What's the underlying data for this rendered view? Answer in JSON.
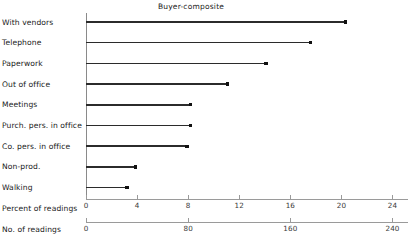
{
  "chart_data": {
    "type": "bar",
    "orientation": "horizontal",
    "title": "Buyer-composite",
    "xlabel": "",
    "ylabel": "",
    "grid": false,
    "legend": null,
    "categories": [
      "With vendors",
      "Telephone",
      "Paperwork",
      "Out of office",
      "Meetings",
      "Purch. pers. in office",
      "Co. pers. in office",
      "Non-prod.",
      "Walking"
    ],
    "values": [
      20.3,
      17.6,
      14.1,
      11.1,
      8.2,
      8.2,
      7.9,
      3.9,
      3.2
    ],
    "series": [
      {
        "name": "Percent of readings",
        "values": [
          20.3,
          17.6,
          14.1,
          11.1,
          8.2,
          8.2,
          7.9,
          3.9,
          3.2
        ]
      }
    ],
    "axes": [
      {
        "name": "Percent of readings",
        "label": "Percent of readings",
        "ticks": [
          0,
          4,
          8,
          12,
          16,
          20,
          24
        ],
        "tick_labels": [
          "0",
          "4",
          "8",
          "12",
          "16",
          "20",
          "24"
        ],
        "range": [
          0,
          25.2
        ]
      },
      {
        "name": "No. of readings",
        "label": "No. of readings",
        "ticks": [
          0,
          80,
          160,
          240
        ],
        "tick_labels": [
          "0",
          "80",
          "160",
          "240"
        ],
        "range": [
          0,
          252
        ]
      }
    ],
    "axis_row_labels": [
      "Percent of readings",
      "No. of readings"
    ],
    "colors": {
      "bar": "#2b2b2b",
      "marker": "#111111",
      "axis": "#9a9a9a",
      "text": "#1a1a1a"
    }
  }
}
